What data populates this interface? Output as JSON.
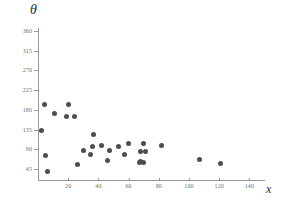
{
  "chart_data": {
    "type": "scatter",
    "title": "",
    "xlabel": "x",
    "ylabel": "θ",
    "xlim": [
      0,
      145
    ],
    "ylim": [
      27,
      378
    ],
    "grid": false,
    "legend": null,
    "xticks": [
      20,
      40,
      60,
      80,
      100,
      120,
      140
    ],
    "yticks": [
      45,
      90,
      135,
      180,
      225,
      270,
      315,
      360
    ],
    "marker": {
      "shape": "circle",
      "color": "#4d4d4d",
      "size_px": 5
    },
    "series": [
      {
        "name": "observations",
        "points": [
          [
            2,
            133
          ],
          [
            4,
            192
          ],
          [
            5,
            76
          ],
          [
            6,
            40
          ],
          [
            11,
            172
          ],
          [
            19,
            165
          ],
          [
            20,
            193
          ],
          [
            24,
            165
          ],
          [
            26,
            55
          ],
          [
            30,
            88
          ],
          [
            35,
            78
          ],
          [
            36,
            97
          ],
          [
            37,
            125
          ],
          [
            42,
            99
          ],
          [
            46,
            65
          ],
          [
            47,
            87
          ],
          [
            53,
            97
          ],
          [
            57,
            78
          ],
          [
            60,
            104
          ],
          [
            67,
            60
          ],
          [
            68,
            62
          ],
          [
            68,
            85
          ],
          [
            70,
            61
          ],
          [
            70,
            103
          ],
          [
            71,
            84
          ],
          [
            82,
            98
          ],
          [
            107,
            67
          ],
          [
            121,
            58
          ]
        ]
      }
    ]
  },
  "axis_titles": {
    "y": "θ",
    "x": "x"
  },
  "tick_labels": {
    "y": [
      "360",
      "315",
      "270",
      "225",
      "180",
      "135",
      "90",
      "45"
    ],
    "x": [
      "20",
      "40",
      "60",
      "80",
      "100",
      "120",
      "140"
    ]
  },
  "colors": {
    "marker": "#4d4d4d",
    "axis": "#9a9a9a",
    "tick_text": "#6e6e6e",
    "title_text": "#2b2b2b",
    "background": "#ffffff"
  }
}
